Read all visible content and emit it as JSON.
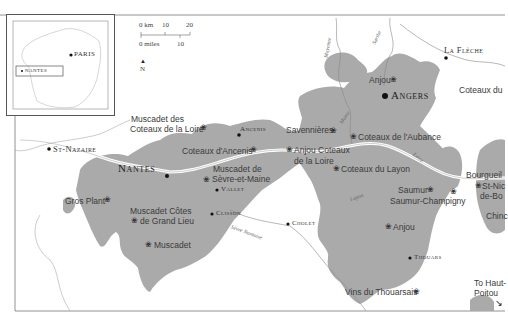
{
  "map": {
    "colors": {
      "vineyard": "#a9a9a9",
      "river": "#ffffff",
      "land": "#ffffff",
      "border": "#555555",
      "text": "#3a3a3a"
    },
    "inset": {
      "labels": {
        "paris": "PARIS",
        "nantes": "NANTES"
      }
    },
    "scale": {
      "km_label": "0 km",
      "km_10": "10",
      "km_20": "20",
      "miles_label": "0 miles",
      "miles_10": "10"
    },
    "north": {
      "arrow": "▲",
      "label": "N"
    },
    "towns": {
      "nantes": "Nantes",
      "angers": "Angers",
      "st_nazaire": "St-Nazaire",
      "ancenis": "Ancenis",
      "vallet": "Vallet",
      "clisson": "Clisson",
      "cholet": "Cholet",
      "thouars": "Thouars",
      "la_fleche": "La Flèche"
    },
    "rivers": {
      "mayenne": "Mayenne",
      "sarthe": "Sarthe",
      "maine": "Maine",
      "loire": "Loire",
      "layon": "Layon",
      "sevre_nantaise": "Sèvre Nantaise"
    },
    "appellations": {
      "muscadet_coteaux_loire_1": "Muscadet des",
      "muscadet_coteaux_loire_2": "Coteaux de la Loire",
      "coteaux_ancenis": "Coteaux d'Ancenis",
      "muscadet_sevre_1": "Muscadet de",
      "muscadet_sevre_2": "Sèvre-et-Maine",
      "gros_plant": "Gros Plant",
      "muscadet_grand_lieu_1": "Muscadet Côtes",
      "muscadet_grand_lieu_2": "de Grand Lieu",
      "muscadet": "Muscadet",
      "savennieres": "Savennières",
      "anjou_coteaux_loire_1": "Anjou Coteaux",
      "anjou_coteaux_loire_2": "de la Loire",
      "coteaux_aubance": "Coteaux de l'Aubance",
      "coteaux_layon": "Coteaux du Layon",
      "anjou_north": "Anjou",
      "anjou_south": "Anjou",
      "saumur": "Saumur",
      "saumur_champigny": "Saumur-Champigny",
      "bourgueil": "Bourgueil",
      "st_nicolas_1": "St-Nic",
      "st_nicolas_2": "de-Bo",
      "chinon": "Chinc",
      "coteaux_du_loir": "Coteaux du",
      "vins_thouarsais": "Vins du Thouarsais",
      "haut_poitou_1": "To Haut-",
      "haut_poitou_2": "Poitou"
    },
    "symbols": {
      "grape": "❀",
      "arrow": "↘"
    }
  }
}
